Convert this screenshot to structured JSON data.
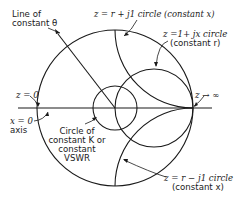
{
  "diagram": {
    "type": "smith-chart-annotated",
    "labels": {
      "line_theta_1": "Line of",
      "line_theta_2": "constant θ",
      "z_plus_j1": "z = r + j1 circle (constant x)",
      "z_1_plus_jx_1": "z =1+ jx circle",
      "z_1_plus_jx_2": "(constant r)",
      "z_zero": "z = 0",
      "z_inf": "z → ∞",
      "x_zero_1": "x = 0",
      "x_zero_2": "axis",
      "vswr_1": "Circle of",
      "vswr_2": "constant K or",
      "vswr_3": "constant",
      "vswr_4": "VSWR",
      "z_minus_j1_1": "z = r − j1 circle",
      "z_minus_j1_2": "(constant x)"
    },
    "colors": {
      "stroke": "#1a1a1a",
      "background": "#ffffff"
    }
  }
}
